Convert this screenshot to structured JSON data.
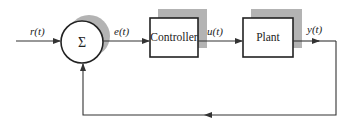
{
  "diagram": {
    "type": "closed-loop feedback control block diagram",
    "colors": {
      "line": "#333333",
      "shadow": "#b3b3b3",
      "background": "#ffffff"
    },
    "summing_junction": {
      "symbol": "Σ"
    },
    "blocks": [
      {
        "id": "controller",
        "label": "Controller"
      },
      {
        "id": "plant",
        "label": "Plant"
      }
    ],
    "signals": {
      "reference": "r(t)",
      "error": "e(t)",
      "control": "u(t)",
      "output": "y(t)"
    },
    "connections": [
      {
        "from": "input",
        "to": "summing_junction",
        "signal": "r(t)"
      },
      {
        "from": "summing_junction",
        "to": "controller",
        "signal": "e(t)"
      },
      {
        "from": "controller",
        "to": "plant",
        "signal": "u(t)"
      },
      {
        "from": "plant",
        "to": "output",
        "signal": "y(t)"
      },
      {
        "from": "output",
        "to": "summing_junction",
        "signal": "feedback"
      }
    ]
  }
}
